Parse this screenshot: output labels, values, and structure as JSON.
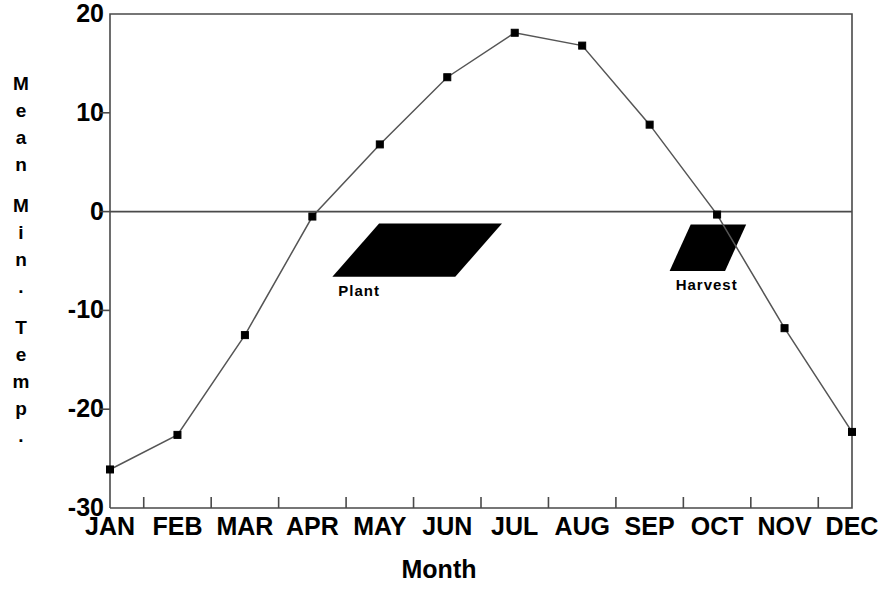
{
  "chart_data": {
    "type": "line",
    "title": "",
    "xlabel": "Month",
    "ylabel": "Mean Min. Temp.",
    "categories": [
      "JAN",
      "FEB",
      "MAR",
      "APR",
      "MAY",
      "JUN",
      "JUL",
      "AUG",
      "SEP",
      "OCT",
      "NOV",
      "DEC"
    ],
    "values": [
      -26.1,
      -22.6,
      -12.5,
      -0.5,
      6.8,
      13.6,
      18.1,
      16.8,
      8.8,
      -0.3,
      -11.8,
      -22.3
    ],
    "series": [
      {
        "name": "Mean Min. Temp.",
        "values": [
          -26.1,
          -22.6,
          -12.5,
          -0.5,
          6.8,
          13.6,
          18.1,
          16.8,
          8.8,
          -0.3,
          -11.8,
          -22.3
        ]
      }
    ],
    "ylim": [
      -30,
      20
    ],
    "yticks": [
      20,
      10,
      0,
      -10,
      -20,
      -30
    ],
    "ytick_labels": [
      "20",
      "10",
      "0",
      "-10",
      "-20",
      "-30"
    ],
    "xtick_labels": [
      "JAN",
      "FEB",
      "MAR",
      "APR",
      "MAY",
      "JUN",
      "JUL",
      "AUG",
      "SEP",
      "OCT",
      "NOV",
      "DEC"
    ],
    "grid": false,
    "zero_line": true,
    "legend": "none",
    "marker": "square",
    "line_color": "#000000",
    "marker_color": "#000000",
    "annotations": [
      {
        "label": "Plant",
        "shape": "parallelogram",
        "fill": "#000000",
        "x_start_month": "APR",
        "x_end_month": "JUN",
        "y_top": -1.2,
        "y_bottom": -6.6
      },
      {
        "label": "Harvest",
        "shape": "parallelogram",
        "fill": "#000000",
        "x_start_month": "SEP",
        "x_end_month": "OCT",
        "y_top": -1.3,
        "y_bottom": -6.0
      }
    ]
  },
  "axis": {
    "y_title_letters": [
      "M",
      "e",
      "a",
      "n",
      "",
      "M",
      "i",
      "n",
      ".",
      "",
      "T",
      "e",
      "m",
      "p",
      "."
    ],
    "y_title_text": "Mean Min. Temp.",
    "x_title_text": "Month"
  },
  "colors": {
    "background": "#ffffff",
    "ink": "#000000",
    "axis": "#4a4a4a",
    "line": "#555555"
  }
}
